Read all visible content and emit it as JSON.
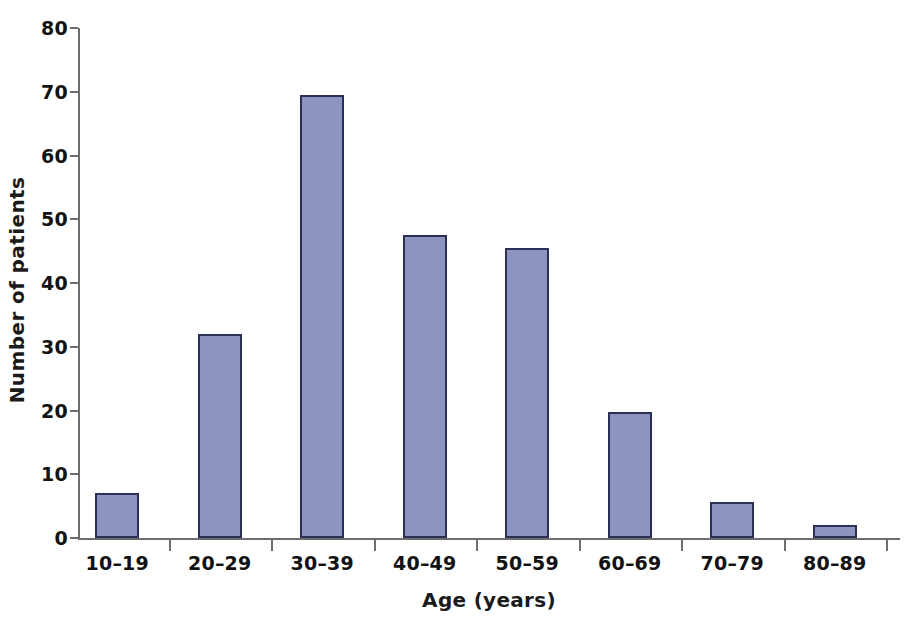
{
  "chart_data": {
    "type": "bar",
    "title": "",
    "xlabel": "Age (years)",
    "ylabel": "Number of patients",
    "categories": [
      "10–19",
      "20–29",
      "30–39",
      "40–49",
      "50–59",
      "60–69",
      "70–79",
      "80–89"
    ],
    "values": [
      7,
      32,
      69.5,
      47.5,
      45.5,
      19.7,
      5.7,
      2
    ],
    "ylim": [
      0,
      80
    ],
    "ytick_labels": [
      "0",
      "10",
      "20",
      "30",
      "40",
      "50",
      "60",
      "70",
      "80"
    ],
    "yticks": [
      0,
      10,
      20,
      30,
      40,
      50,
      60,
      70,
      80
    ],
    "grid": false,
    "legend": null,
    "bar_color": "#8e94c0",
    "bar_border_color": "#2b2f55",
    "axis_color": "#6d6d6d",
    "text_color": "#121212",
    "background": "#ffffff"
  }
}
